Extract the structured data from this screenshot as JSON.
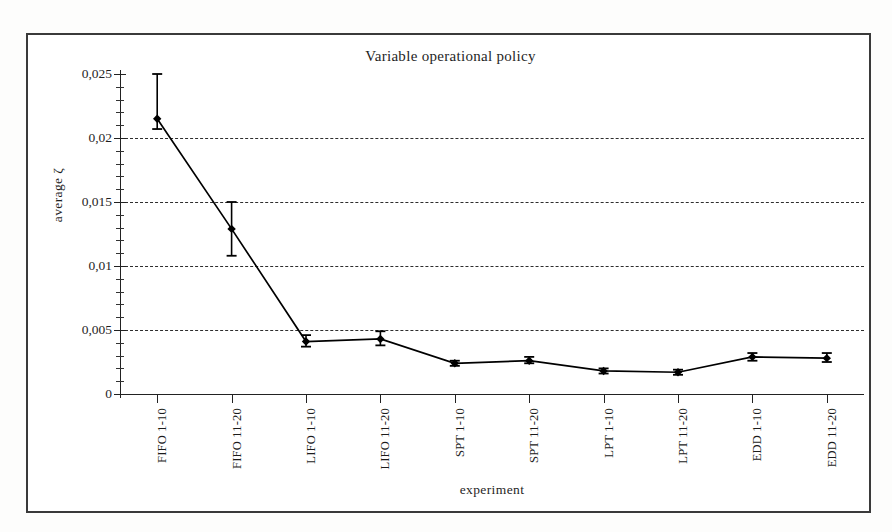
{
  "figure": {
    "title": "Variable operational policy",
    "x_axis_title": "experiment",
    "y_axis_title": "average ζ"
  },
  "chart_data": {
    "type": "line",
    "title": "Variable operational policy",
    "xlabel": "experiment",
    "ylabel": "average ζ",
    "grid": true,
    "legend": false,
    "ylim": [
      0,
      0.025
    ],
    "ytick_labels": [
      "0,025",
      "0,02",
      "0,015",
      "0,01",
      "0,005",
      "0"
    ],
    "ytick_values": [
      0.025,
      0.02,
      0.015,
      0.01,
      0.005,
      0
    ],
    "yminor_step": 0.001,
    "gridline_values": [
      0.02,
      0.015,
      0.01,
      0.005
    ],
    "categories": [
      "FIFO 1-10",
      "FIFO 11-20",
      "LIFO 1-10",
      "LIFO 11-20",
      "SPT 1-10",
      "SPT 11-20",
      "LPT 1-10",
      "LPT 11-20",
      "EDD 1-10",
      "EDD 11-20"
    ],
    "series": [
      {
        "name": "average ζ",
        "marker": "diamond",
        "color": "#000000",
        "values": [
          0.0215,
          0.0129,
          0.0041,
          0.0043,
          0.0024,
          0.0026,
          0.0018,
          0.0017,
          0.0029,
          0.0028
        ],
        "error_low": [
          0.0207,
          0.0108,
          0.0037,
          0.0038,
          0.0022,
          0.0024,
          0.0016,
          0.0015,
          0.0026,
          0.0025
        ],
        "error_high": [
          0.025,
          0.015,
          0.0046,
          0.0049,
          0.0026,
          0.0029,
          0.002,
          0.0019,
          0.0032,
          0.0032
        ]
      }
    ]
  },
  "colors": {
    "frame": "#3a3a3a",
    "ink": "#1a1a1a",
    "paper": "#ffffff",
    "gridline": "#2e2e2e"
  }
}
